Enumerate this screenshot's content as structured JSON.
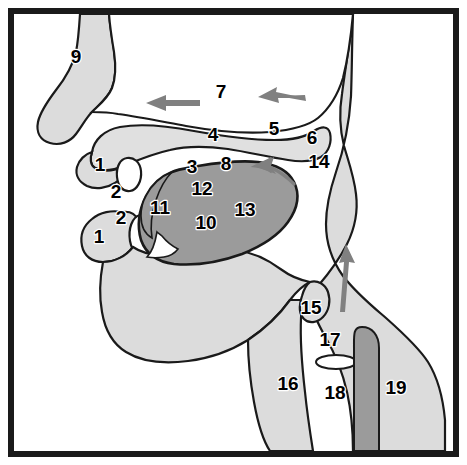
{
  "figure": {
    "type": "anatomical-diagram",
    "canvas": {
      "width": 467,
      "height": 465
    },
    "background_color": "#ffffff",
    "border_color": "#1a1a1a",
    "colors": {
      "outline": "#1a1a1a",
      "tissue_light": "#dcdcdc",
      "tongue_dark": "#9b9b9b",
      "palate_band": "#e0e0e0",
      "air_space": "#ffffff",
      "arrow": "#808080",
      "label_text": "#000000"
    }
  },
  "labels": [
    {
      "id": "1-upper",
      "text": "1",
      "x": 100,
      "y": 166
    },
    {
      "id": "2-upper",
      "text": "2",
      "x": 116,
      "y": 193
    },
    {
      "id": "2-lower",
      "text": "2",
      "x": 121,
      "y": 219
    },
    {
      "id": "1-lower",
      "text": "1",
      "x": 99,
      "y": 238
    },
    {
      "id": "3",
      "text": "3",
      "x": 192,
      "y": 168
    },
    {
      "id": "4",
      "text": "4",
      "x": 213,
      "y": 136
    },
    {
      "id": "5",
      "text": "5",
      "x": 274,
      "y": 130
    },
    {
      "id": "6",
      "text": "6",
      "x": 312,
      "y": 139
    },
    {
      "id": "7",
      "text": "7",
      "x": 221,
      "y": 93
    },
    {
      "id": "8",
      "text": "8",
      "x": 226,
      "y": 165
    },
    {
      "id": "9",
      "text": "9",
      "x": 76,
      "y": 58
    },
    {
      "id": "10",
      "text": "10",
      "x": 206,
      "y": 224
    },
    {
      "id": "11",
      "text": "11",
      "x": 160,
      "y": 209
    },
    {
      "id": "12",
      "text": "12",
      "x": 202,
      "y": 190
    },
    {
      "id": "13",
      "text": "13",
      "x": 245,
      "y": 211
    },
    {
      "id": "14",
      "text": "14",
      "x": 319,
      "y": 163
    },
    {
      "id": "15",
      "text": "15",
      "x": 311,
      "y": 309
    },
    {
      "id": "16",
      "text": "16",
      "x": 288,
      "y": 385
    },
    {
      "id": "17",
      "text": "17",
      "x": 330,
      "y": 341
    },
    {
      "id": "18",
      "text": "18",
      "x": 335,
      "y": 394
    },
    {
      "id": "19",
      "text": "19",
      "x": 396,
      "y": 389
    }
  ],
  "arrows": [
    {
      "id": "nasal-airflow-left",
      "direction": "left",
      "description": "airflow arrow in nasal cavity, left side"
    },
    {
      "id": "nasal-airflow-right",
      "direction": "left",
      "description": "airflow arrow in nasal cavity, right side"
    },
    {
      "id": "pharynx-upper",
      "direction": "up-left",
      "description": "curved airflow arrow toward velopharyngeal port"
    },
    {
      "id": "trachea-up",
      "direction": "up",
      "description": "airflow arrow rising through the pharynx"
    }
  ]
}
